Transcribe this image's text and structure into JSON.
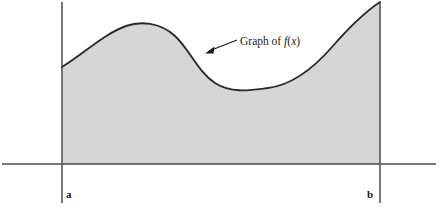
{
  "figure": {
    "title_label": "Graph of f(x)",
    "label_parts": {
      "prefix": "Graph of ",
      "function_letter": "f",
      "open_paren": "(",
      "variable": "x",
      "close_paren": ")"
    },
    "endpoint_left": "a",
    "endpoint_right": "b",
    "colors": {
      "background": "#ffffff",
      "region_fill": "#d6d6d6",
      "curve_stroke": "#2b2b2b",
      "axis_stroke": "#4a4a4a",
      "boundary_stroke": "#555555",
      "text": "#1a1a1a"
    },
    "geometry": {
      "axis_y": 164,
      "axis_x_start": 2,
      "axis_x_end": 436,
      "left_boundary_x": 62,
      "right_boundary_x": 380,
      "boundary_top_left_y": 2,
      "boundary_bottom_y": 203,
      "curve_start": [
        62,
        67
      ],
      "curve_local_max": [
        148,
        22
      ],
      "curve_local_min": [
        265,
        88
      ],
      "curve_end": [
        380,
        2
      ],
      "arrow_tip": [
        206,
        52
      ],
      "arrow_tail": [
        237,
        40
      ],
      "label_x": 240,
      "label_y": 44,
      "label_a_x": 66,
      "label_a_y": 197,
      "label_b_x": 367,
      "label_b_y": 197
    }
  }
}
